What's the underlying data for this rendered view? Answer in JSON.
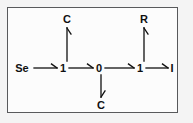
{
  "figure": {
    "background_color": "#fcfcfc",
    "outer_background_color": "#f4f4f4",
    "border_color": "#58595b",
    "ink_color": "#101010"
  },
  "nodes": [
    {
      "id": "start",
      "label": "Se",
      "x": 22,
      "y": 68
    },
    {
      "id": "s1",
      "label": "1",
      "x": 63,
      "y": 68
    },
    {
      "id": "s0",
      "label": "0",
      "x": 99,
      "y": 68
    },
    {
      "id": "s2",
      "label": "1",
      "x": 140,
      "y": 68
    },
    {
      "id": "end",
      "label": "I",
      "x": 172,
      "y": 68
    },
    {
      "id": "up1",
      "label": "C",
      "x": 67,
      "y": 19
    },
    {
      "id": "up2",
      "label": "R",
      "x": 144,
      "y": 19
    },
    {
      "id": "down1",
      "label": "C",
      "x": 101,
      "y": 105
    }
  ],
  "edges": [
    {
      "id": "e1",
      "from": "start",
      "to": "s1",
      "direction": "right",
      "label": ""
    },
    {
      "id": "e2",
      "from": "s1",
      "to": "s0",
      "direction": "right",
      "label": ""
    },
    {
      "id": "e3",
      "from": "s0",
      "to": "s2",
      "direction": "right",
      "label": ""
    },
    {
      "id": "e4",
      "from": "s2",
      "to": "end",
      "direction": "right",
      "label": ""
    },
    {
      "id": "e5",
      "from": "s1",
      "to": "up1",
      "direction": "up",
      "label": ""
    },
    {
      "id": "e6",
      "from": "s2",
      "to": "up2",
      "direction": "up",
      "label": ""
    },
    {
      "id": "e7",
      "from": "s0",
      "to": "down1",
      "direction": "down",
      "label": ""
    }
  ],
  "sequence": "Se -> 1 -> 0 -> 1 -> I"
}
